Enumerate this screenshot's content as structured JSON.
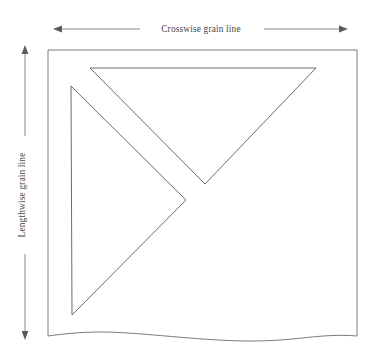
{
  "figure": {
    "background_color": "#ffffff",
    "line_color": "#5a5a5a",
    "text_color": "#4a4a4a",
    "caption_color": "#8c8c8c",
    "width": 379,
    "height": 359
  },
  "labels": {
    "crosswise": "Crosswise grain line",
    "lengthwise": "Lengthwise grain line",
    "caption": ""
  },
  "fabric": {
    "name": "fabric-yardage",
    "left": 48,
    "top": 50,
    "right": 357,
    "bottom": 336,
    "selvage_note": ""
  },
  "pattern_pieces": [
    {
      "name": "upper-triangle",
      "points": "90,68 316,68 205,184",
      "vertices": [
        [
          90,
          68
        ],
        [
          316,
          68
        ],
        [
          205,
          184
        ]
      ]
    },
    {
      "name": "left-triangle",
      "points": "71,86 186,200 72,315",
      "vertices": [
        [
          71,
          86
        ],
        [
          186,
          200
        ],
        [
          72,
          315
        ]
      ]
    }
  ],
  "arrows": {
    "crosswise": {
      "orientation": "horizontal",
      "y": 29,
      "x_start": 56,
      "x_end": 345,
      "double_headed": true
    },
    "lengthwise": {
      "orientation": "vertical",
      "x": 25,
      "y_start": 48,
      "y_end": 337,
      "double_headed": true
    }
  }
}
